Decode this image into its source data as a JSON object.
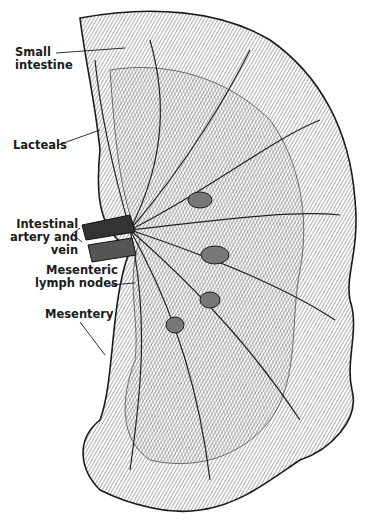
{
  "figure": {
    "colors": {
      "ink": "#1a1a1a",
      "background": "#ffffff",
      "shade": "#555555"
    },
    "labels": [
      {
        "id": "small-intestine",
        "text": "Small\nintestine"
      },
      {
        "id": "lacteals",
        "text": "Lacteals"
      },
      {
        "id": "intestinal-artery-vein",
        "text": "Intestinal\nartery and\nvein"
      },
      {
        "id": "mesenteric-lymph-nodes",
        "text": "Mesenteric\nlymph nodes"
      },
      {
        "id": "mesentery",
        "text": "Mesentery"
      }
    ]
  }
}
